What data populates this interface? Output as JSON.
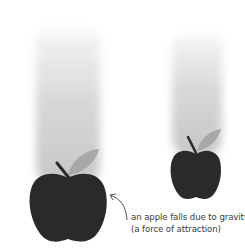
{
  "figure": {
    "caption": {
      "line1": "an apple falls due to gravity",
      "line2": "(a force of attraction)"
    },
    "colors": {
      "apple_body": "#2a2a2a",
      "leaf": "#a8a8a8",
      "stem": "#2a2a2a",
      "trail": "#c8c8c8",
      "arrow": "#555555",
      "text": "#3a3a3a"
    },
    "objects": [
      {
        "name": "large-apple",
        "position": "left",
        "size": "large"
      },
      {
        "name": "small-apple",
        "position": "right",
        "size": "small"
      }
    ]
  }
}
